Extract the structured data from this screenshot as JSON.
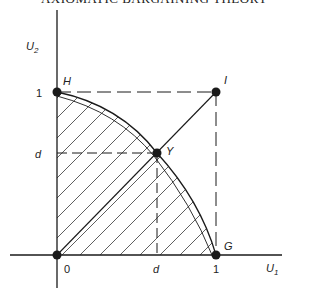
{
  "header": {
    "running_title": "AXIOMATIC BARGAINING THEORY"
  },
  "axes": {
    "x_label": "U",
    "x_label_sub": "1",
    "y_label": "U",
    "y_label_sub": "2",
    "origin_label": "0",
    "x_tick_d": "d",
    "x_tick_1": "1",
    "y_tick_d": "d",
    "y_tick_1": "1"
  },
  "points": {
    "H": "H",
    "I": "I",
    "Y": "Y",
    "G": "G"
  },
  "colors": {
    "ink": "#1a1a1a",
    "background": "#ffffff"
  }
}
